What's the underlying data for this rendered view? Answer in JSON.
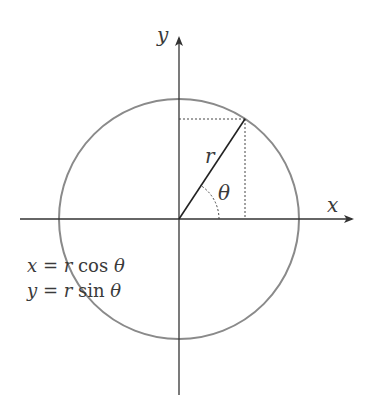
{
  "diagram": {
    "axes": {
      "x_label": "x",
      "y_label": "y"
    },
    "labels": {
      "radius": "r",
      "angle": "θ"
    },
    "equations": [
      {
        "lhs": "x",
        "eq": " = ",
        "r": "r",
        "fn": " cos ",
        "theta": "θ"
      },
      {
        "lhs": "y",
        "eq": " = ",
        "r": "r",
        "fn": " sin ",
        "theta": "θ"
      }
    ],
    "colors": {
      "circle": "#8a8a8a",
      "axes": "#333333",
      "radius": "#222222",
      "dotted": "#444444",
      "text": "#3a3a3a"
    }
  }
}
